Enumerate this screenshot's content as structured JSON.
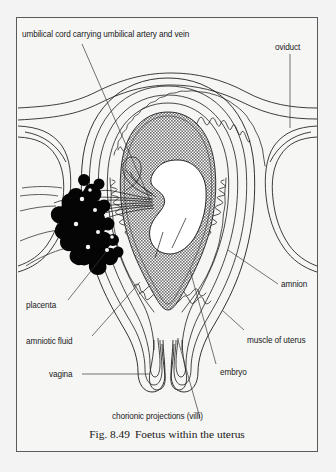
{
  "figure": {
    "caption_number": "Fig. 8.49",
    "caption_title": "Foetus within the uterus",
    "frame_border_color": "#5a5a5a",
    "page_background": "#f2f2f2",
    "panel_background": "#f6f6f5",
    "ink_color": "#1a1a1a",
    "amniotic_fluid_fill": "#9a9a9a",
    "placenta_fill": "#000000",
    "embryo_fill": "#ffffff"
  },
  "labels": {
    "umbilical_cord": "umbilical cord carrying umbilical artery and vein",
    "oviduct": "oviduct",
    "amnion": "amnion",
    "muscle_of_uterus": "muscle of uterus",
    "embryo": "embryo",
    "placenta": "placenta",
    "amniotic_fluid": "amniotic fluid",
    "vagina": "vagina",
    "chorionic_projections": "chorionic  projections (villi)"
  },
  "diagram": {
    "type": "anatomical-cross-section",
    "subject": "foetus within the uterus",
    "structures": [
      "umbilical cord carrying umbilical artery and vein",
      "oviduct",
      "amnion",
      "muscle of uterus",
      "embryo",
      "placenta",
      "amniotic fluid",
      "vagina",
      "chorionic projections (villi)"
    ]
  }
}
